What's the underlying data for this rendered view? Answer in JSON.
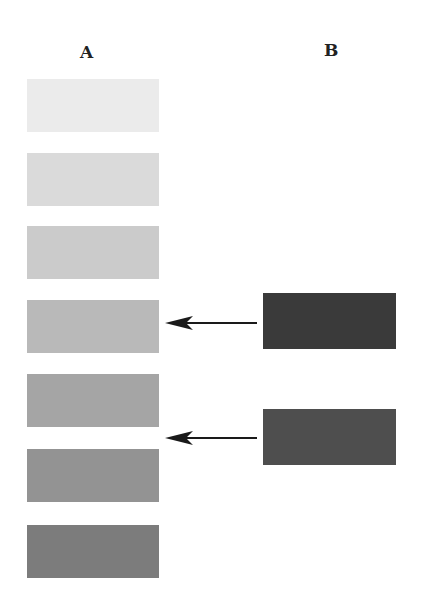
{
  "columns": {
    "a": {
      "label": "A"
    },
    "b": {
      "label": "B"
    }
  },
  "column_a_swatches": [
    {
      "id": "a1",
      "color": "#ebebeb",
      "top": 79
    },
    {
      "id": "a2",
      "color": "#dadada",
      "top": 153
    },
    {
      "id": "a3",
      "color": "#cbcbcb",
      "top": 226
    },
    {
      "id": "a4",
      "color": "#b9b9b9",
      "top": 300
    },
    {
      "id": "a5",
      "color": "#a5a5a5",
      "top": 374
    },
    {
      "id": "a6",
      "color": "#939393",
      "top": 449
    },
    {
      "id": "a7",
      "color": "#7c7c7c",
      "top": 525
    }
  ],
  "column_b_swatches": [
    {
      "id": "b1",
      "color": "#3a3a3a",
      "top": 293,
      "points_to": "a4"
    },
    {
      "id": "b2",
      "color": "#4e4e4e",
      "top": 409,
      "points_to": "between a5 and a6"
    }
  ],
  "arrows": [
    {
      "from": "b1",
      "y": 323
    },
    {
      "from": "b2",
      "y": 438
    }
  ]
}
